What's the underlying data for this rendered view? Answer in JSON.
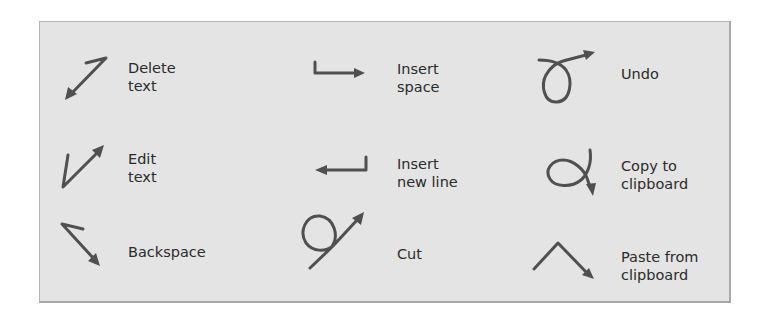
{
  "figure": {
    "accent_color": "#505050",
    "background_color": "#e4e4e4",
    "columns": [
      {
        "items": [
          {
            "id": "delete-text",
            "icon": "delete-text-gesture-icon",
            "label_lines": [
              "Delete",
              "text"
            ]
          },
          {
            "id": "edit-text",
            "icon": "edit-text-gesture-icon",
            "label_lines": [
              "Edit",
              "text"
            ]
          },
          {
            "id": "backspace",
            "icon": "backspace-gesture-icon",
            "label_lines": [
              "Backspace"
            ]
          }
        ]
      },
      {
        "items": [
          {
            "id": "insert-space",
            "icon": "insert-space-gesture-icon",
            "label_lines": [
              "Insert",
              "space"
            ]
          },
          {
            "id": "insert-new-line",
            "icon": "insert-new-line-gesture-icon",
            "label_lines": [
              "Insert",
              "new line"
            ]
          },
          {
            "id": "cut",
            "icon": "cut-gesture-icon",
            "label_lines": [
              "Cut"
            ]
          }
        ]
      },
      {
        "items": [
          {
            "id": "undo",
            "icon": "undo-gesture-icon",
            "label_lines": [
              "Undo"
            ]
          },
          {
            "id": "copy-to-clipboard",
            "icon": "copy-gesture-icon",
            "label_lines": [
              "Copy to",
              "clipboard"
            ]
          },
          {
            "id": "paste-from-clipboard",
            "icon": "paste-gesture-icon",
            "label_lines": [
              "Paste from",
              "clipboard"
            ]
          }
        ]
      }
    ]
  }
}
